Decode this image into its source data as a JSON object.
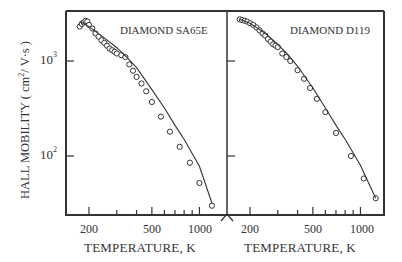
{
  "chart_data": [
    {
      "type": "scatter",
      "title": "DIAMOND SA65E",
      "xlabel": "TEMPERATURE, K",
      "ylabel": "HALL MOBILITY (cm²/V·s)",
      "xscale": "log",
      "yscale": "log",
      "xlim": [
        170,
        1300
      ],
      "ylim": [
        25,
        3200
      ],
      "xticks": [
        200,
        500,
        1000
      ],
      "yticks": [
        "10^2",
        "10^3"
      ],
      "grid": false,
      "series": [
        {
          "name": "measured",
          "marker": "open-circle",
          "x": [
            175,
            180,
            185,
            190,
            195,
            200,
            210,
            220,
            230,
            240,
            250,
            260,
            270,
            280,
            290,
            300,
            320,
            340,
            360,
            380,
            400,
            430,
            460,
            500,
            570,
            650,
            750,
            870,
            1000,
            1200
          ],
          "y": [
            2300,
            2450,
            2550,
            2650,
            2600,
            2400,
            2200,
            1950,
            1800,
            1650,
            1550,
            1450,
            1350,
            1300,
            1250,
            1200,
            1150,
            1100,
            920,
            790,
            680,
            580,
            480,
            370,
            260,
            180,
            125,
            85,
            52,
            30
          ]
        },
        {
          "name": "theory-fit",
          "style": "line",
          "x": [
            175,
            200,
            250,
            300,
            350,
            400,
            500,
            600,
            700,
            800,
            1000,
            1200
          ],
          "y": [
            2600,
            2300,
            1750,
            1380,
            1080,
            850,
            500,
            320,
            210,
            150,
            78,
            32
          ]
        }
      ]
    },
    {
      "type": "scatter",
      "title": "DIAMOND D119",
      "xlabel": "TEMPERATURE, K",
      "xscale": "log",
      "yscale": "log",
      "xlim": [
        170,
        1300
      ],
      "ylim": [
        25,
        3200
      ],
      "xticks": [
        200,
        500,
        1000
      ],
      "grid": false,
      "series": [
        {
          "name": "measured",
          "marker": "open-circle",
          "x": [
            172,
            178,
            185,
            192,
            200,
            210,
            220,
            230,
            240,
            250,
            260,
            270,
            280,
            290,
            300,
            320,
            340,
            360,
            400,
            440,
            480,
            530,
            600,
            700,
            870,
            1050,
            1250
          ],
          "y": [
            2750,
            2700,
            2650,
            2600,
            2500,
            2400,
            2250,
            2100,
            1950,
            1850,
            1700,
            1600,
            1500,
            1450,
            1400,
            1200,
            1100,
            1000,
            800,
            650,
            520,
            400,
            290,
            175,
            100,
            58,
            36
          ]
        },
        {
          "name": "theory-fit",
          "style": "line",
          "x": [
            172,
            200,
            250,
            300,
            350,
            400,
            500,
            600,
            700,
            800,
            1000,
            1250
          ],
          "y": [
            2750,
            2500,
            1950,
            1500,
            1150,
            880,
            520,
            320,
            210,
            150,
            80,
            36
          ]
        }
      ]
    }
  ],
  "labels": {
    "panel_left_title": "DIAMOND SA65E",
    "panel_right_title": "DIAMOND D119",
    "ylabel_main": "HALL MOBILITY ( cm",
    "ylabel_sup": "2",
    "ylabel_tail": "/ V·s )",
    "ytick_1000_base": "10",
    "ytick_1000_exp": "3",
    "ytick_100_base": "10",
    "ytick_100_exp": "2",
    "xtick_200": "200",
    "xtick_500": "500",
    "xtick_1000": "1000",
    "xlabel": "TEMPERATURE, K"
  }
}
